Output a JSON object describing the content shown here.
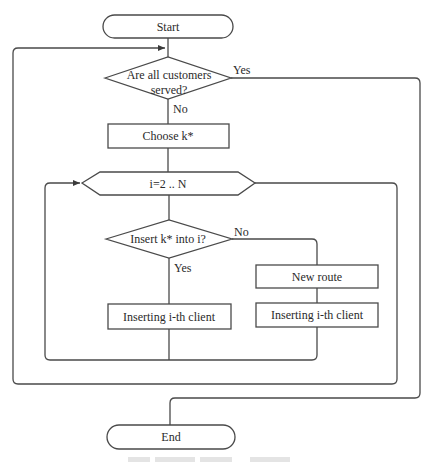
{
  "diagram": {
    "type": "flowchart",
    "nodes": {
      "start": {
        "label": "Start",
        "shape": "terminator"
      },
      "all_served": {
        "label_line1": "Are all customers",
        "label_line2": "served?",
        "shape": "decision"
      },
      "choose_k": {
        "label": "Choose k*",
        "shape": "process"
      },
      "loop_i": {
        "label": "i=2 .. N",
        "shape": "loop-hexagon"
      },
      "insert_k": {
        "label": "Insert  k* into i?",
        "shape": "decision"
      },
      "new_route": {
        "label": "New route",
        "shape": "process"
      },
      "inserting_left": {
        "label": "Inserting i-th client",
        "shape": "process"
      },
      "inserting_right": {
        "label": "Inserting i-th client",
        "shape": "process"
      },
      "end": {
        "label": "End",
        "shape": "terminator"
      }
    },
    "edge_labels": {
      "all_served_yes": "Yes",
      "all_served_no": "No",
      "insert_no": "No",
      "insert_yes": "Yes"
    },
    "edges": [
      {
        "from": "start",
        "to": "all_served"
      },
      {
        "from": "all_served",
        "to": "choose_k",
        "label": "No"
      },
      {
        "from": "all_served",
        "to": "end",
        "label": "Yes"
      },
      {
        "from": "choose_k",
        "to": "loop_i"
      },
      {
        "from": "loop_i",
        "to": "insert_k"
      },
      {
        "from": "insert_k",
        "to": "inserting_left",
        "label": "Yes"
      },
      {
        "from": "insert_k",
        "to": "new_route",
        "label": "No"
      },
      {
        "from": "new_route",
        "to": "inserting_right"
      },
      {
        "from": "inserting_left",
        "to": "loop_i"
      },
      {
        "from": "inserting_right",
        "to": "loop_i"
      },
      {
        "from": "loop_i",
        "to": "all_served"
      }
    ],
    "colors": {
      "stroke": "#4a4a4a",
      "text": "#2a2a2a",
      "background": "#ffffff"
    }
  }
}
